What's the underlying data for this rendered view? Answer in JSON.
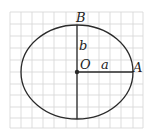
{
  "diagram": {
    "type": "ellipse-on-grid",
    "labels": {
      "top_point": "B",
      "right_point": "A",
      "center": "O",
      "semi_minor": "b",
      "semi_major": "a"
    },
    "colors": {
      "grid": "#d4d4d4",
      "stroke": "#2a2a2a",
      "background": "#ffffff"
    },
    "grid": {
      "columns": 12,
      "rows": 11
    }
  }
}
